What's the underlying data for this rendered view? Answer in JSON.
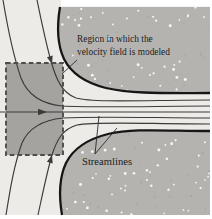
{
  "figure": {
    "region_label": {
      "line1": "Region in which the",
      "line2": "velocity field is modeled"
    },
    "streamlines_label": "Streamlines"
  },
  "diagram": {
    "type": "flow-streamline-diagram",
    "modeled_region_shape": "dashed rectangle",
    "thin_streamline_count": 5,
    "boundary_curve_count": 2,
    "flow_arrow_count": 3,
    "flow_direction": "left to right, converging into horizontal channel"
  },
  "palette": {
    "page_bg": "#ffffff",
    "flow_bg": "#edebe7",
    "stipple_fill": "#b5b3b0",
    "square_fill": "#a19f9c",
    "square_border": "#4c4c4a",
    "streamline": "#3b3b3b",
    "boundary": "#161616",
    "text": "#1c1c1c",
    "dot_white": "#f7f6f4",
    "dot_dark": "#a09e9a",
    "leader": "#2a2a2a"
  }
}
